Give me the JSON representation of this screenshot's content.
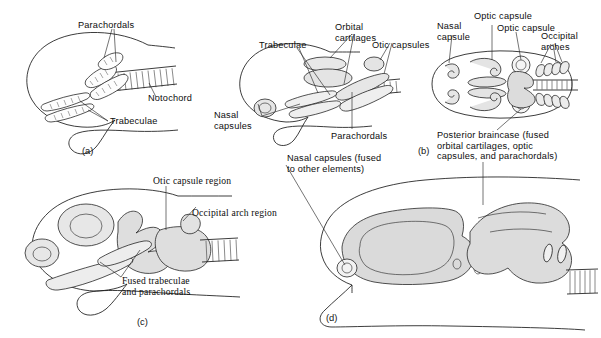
{
  "figure": {
    "panel_count": 4,
    "ink_color": "#1a1a1a",
    "background_color": "#ffffff",
    "stipple_color": "#555555"
  },
  "panel_a": {
    "letter": "(a)",
    "labels": {
      "parachordals": "Parachordals",
      "notochord": "Notochord",
      "trabeculae": "Trabeculae"
    }
  },
  "panel_b": {
    "letter": "(b)",
    "labels": {
      "orbital_cartilages": "Orbital\ncartilages",
      "trabeculae": "Trabeculae",
      "otic_capsules": "Otic capsules",
      "nasal_capsules": "Nasal\ncapsules",
      "parachordals": "Parachordals",
      "nasal_capsule": "Nasal\ncapsule",
      "optic_capsule_upper": "Optic capsule",
      "optic_capsule_lower": "Optic capsule",
      "occipital_arches": "Occipital\narches",
      "posterior_braincase": "Posterior braincase (fused\norbital cartilages, optic\ncapsules, and parachordals)"
    }
  },
  "panel_c": {
    "letter": "(c)",
    "labels": {
      "otic_capsule_region": "Otic capsule region",
      "occipital_arch_region": "Occipital arch region",
      "fused_trabeculae": "Fused trabeculae\nand parachordals"
    }
  },
  "panel_d": {
    "letter": "(d)",
    "labels": {
      "nasal_capsules": "Nasal capsules (fused\nto other elements)",
      "posterior_braincase": "Posterior braincase (fused\norbital cartilages, optic\ncapsules, and parachordals)"
    }
  }
}
